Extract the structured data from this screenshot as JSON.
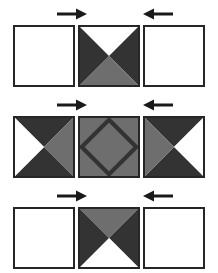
{
  "figure": {
    "title": "",
    "colors": {
      "background": "#ffffff",
      "tile_border": "#262626",
      "dark_fill": "#333333",
      "gray_fill": "#6e6e6e",
      "white_fill": "#ffffff",
      "arrow": "#1a1a1a"
    },
    "rows": [
      {
        "row_index": 0,
        "arrows": [
          {
            "name": "arrow-right",
            "direction": "right",
            "glyph": "→",
            "column": 0
          },
          {
            "name": "arrow-left",
            "direction": "left",
            "glyph": "←",
            "column": 2
          }
        ],
        "tiles": [
          {
            "name": "tile-blank",
            "pattern": "blank",
            "triangles": {
              "top": "white",
              "right": "white",
              "bottom": "white",
              "left": "white"
            }
          },
          {
            "name": "tile-hourglass-white-top-gray-bottom",
            "pattern": "four-triangles",
            "triangles": {
              "top": "white",
              "right": "dark",
              "bottom": "gray",
              "left": "dark"
            }
          },
          {
            "name": "tile-blank",
            "pattern": "blank",
            "triangles": {
              "top": "white",
              "right": "white",
              "bottom": "white",
              "left": "white"
            }
          }
        ]
      },
      {
        "row_index": 1,
        "arrows": [
          {
            "name": "arrow-right",
            "direction": "right",
            "glyph": "→",
            "column": 0
          },
          {
            "name": "arrow-left",
            "direction": "left",
            "glyph": "←",
            "column": 2
          }
        ],
        "tiles": [
          {
            "name": "tile-bowtie-white-left-gray-right",
            "pattern": "four-triangles",
            "triangles": {
              "top": "dark",
              "right": "gray",
              "bottom": "dark",
              "left": "white"
            }
          },
          {
            "name": "tile-gray-with-diamond",
            "pattern": "diamond-outline",
            "triangles": {
              "top": "gray",
              "right": "gray",
              "bottom": "gray",
              "left": "gray"
            },
            "diamond": {
              "fill": "gray",
              "stroke": "dark"
            }
          },
          {
            "name": "tile-bowtie-gray-left-white-right",
            "pattern": "four-triangles",
            "triangles": {
              "top": "dark",
              "right": "white",
              "bottom": "dark",
              "left": "gray"
            }
          }
        ]
      },
      {
        "row_index": 2,
        "arrows": [
          {
            "name": "arrow-right",
            "direction": "right",
            "glyph": "→",
            "column": 0
          },
          {
            "name": "arrow-left",
            "direction": "left",
            "glyph": "←",
            "column": 2
          }
        ],
        "tiles": [
          {
            "name": "tile-blank",
            "pattern": "blank",
            "triangles": {
              "top": "white",
              "right": "white",
              "bottom": "white",
              "left": "white"
            }
          },
          {
            "name": "tile-hourglass-gray-top-white-bottom",
            "pattern": "four-triangles",
            "triangles": {
              "top": "gray",
              "right": "dark",
              "bottom": "white",
              "left": "dark"
            }
          },
          {
            "name": "tile-blank",
            "pattern": "blank",
            "triangles": {
              "top": "white",
              "right": "white",
              "bottom": "white",
              "left": "white"
            }
          }
        ]
      }
    ]
  }
}
